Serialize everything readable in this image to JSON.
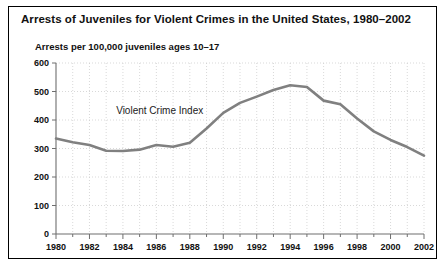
{
  "figure": {
    "title": "Arrests of Juveniles for Violent Crimes in the United States, 1980–2002",
    "axis_note": "Arrests per 100,000 juveniles ages 10–17",
    "border_color": "#000000",
    "background_color": "#ffffff"
  },
  "chart_data": {
    "type": "line",
    "title": "Arrests of Juveniles for Violent Crimes in the United States, 1980–2002",
    "subtitle": "Arrests per 100,000 juveniles ages 10–17",
    "xlabel": "",
    "ylabel": "Arrests per 100,000 juveniles ages 10–17",
    "xlim": [
      1980,
      2002
    ],
    "ylim": [
      0,
      600
    ],
    "grid": true,
    "legend_position": "inline-annotation",
    "line_color": "#808080",
    "annotations": [
      {
        "text": "Violent Crime Index",
        "x": 1986.2,
        "y": 420
      }
    ],
    "ytick_labels": [
      "0",
      "100",
      "200",
      "300",
      "400",
      "500",
      "600"
    ],
    "yticks": [
      0,
      100,
      200,
      300,
      400,
      500,
      600
    ],
    "xtick_labels": [
      "1980",
      "1982",
      "1984",
      "1986",
      "1988",
      "1990",
      "1992",
      "1994",
      "1996",
      "1998",
      "2000",
      "2002"
    ],
    "xticks": [
      1980,
      1982,
      1984,
      1986,
      1988,
      1990,
      1992,
      1994,
      1996,
      1998,
      2000,
      2002
    ],
    "xminor_ticks": [
      1981,
      1983,
      1985,
      1987,
      1989,
      1991,
      1993,
      1995,
      1997,
      1999,
      2001
    ],
    "x": [
      1980,
      1981,
      1982,
      1983,
      1984,
      1985,
      1986,
      1987,
      1988,
      1989,
      1990,
      1991,
      1992,
      1993,
      1994,
      1995,
      1996,
      1997,
      1998,
      1999,
      2000,
      2001,
      2002
    ],
    "series": [
      {
        "name": "Violent Crime Index",
        "values": [
          335,
          322,
          312,
          292,
          291,
          296,
          312,
          306,
          320,
          370,
          425,
          460,
          482,
          505,
          522,
          516,
          468,
          455,
          405,
          360,
          330,
          305,
          275
        ]
      }
    ]
  }
}
